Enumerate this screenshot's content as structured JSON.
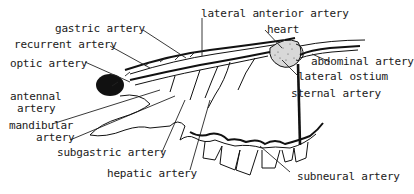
{
  "figure": {
    "type": "anatomical line drawing"
  },
  "labels": {
    "lateral_anterior_artery": "lateral anterior artery",
    "heart": "heart",
    "gastric_artery": "gastric artery",
    "recurrent_artery": "recurrent artery",
    "optic_artery": "optic artery",
    "abdominal_artery": "abdominal artery",
    "lateral_ostium": "lateral ostium",
    "sternal_artery": "sternal artery",
    "antennal_artery_1": "antennal",
    "antennal_artery_2": "artery",
    "mandibular_artery_1": "mandibular",
    "mandibular_artery_2": "artery",
    "subgastric_artery": "subgastric artery",
    "hepatic_artery": "hepatic artery",
    "subneural_artery": "subneural artery"
  },
  "colors": {
    "ink": "#111111",
    "background": "#ffffff"
  }
}
